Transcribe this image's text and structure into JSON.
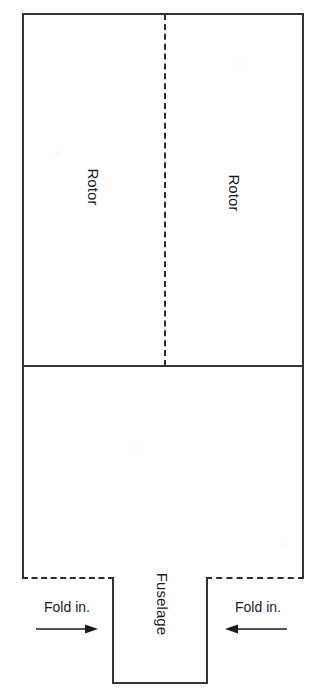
{
  "diagram": {
    "background_color": "#ffffff",
    "line_color": "#333333",
    "dash_color": "#2b2b2b",
    "sheet": {
      "x": 22,
      "y": 13,
      "width": 282,
      "height": 671
    },
    "sections": {
      "rotor": {
        "label_left": "Rotor",
        "label_right": "Rotor",
        "fold_line_orientation": "vertical",
        "fold_line_style": "dashed"
      },
      "fuselage": {
        "label": "Fuselage"
      }
    },
    "divider": {
      "orientation": "horizontal",
      "style": "solid",
      "y": 366
    },
    "flaps": [
      {
        "side": "left",
        "label": "Fold in.",
        "arrow_direction": "right",
        "arrow_icon": "arrow-right-icon",
        "top_edge_style": "dashed",
        "inner_edge_style": "solid"
      },
      {
        "side": "right",
        "label": "Fold in.",
        "arrow_direction": "left",
        "arrow_icon": "arrow-left-icon",
        "top_edge_style": "dashed",
        "inner_edge_style": "solid"
      }
    ]
  }
}
